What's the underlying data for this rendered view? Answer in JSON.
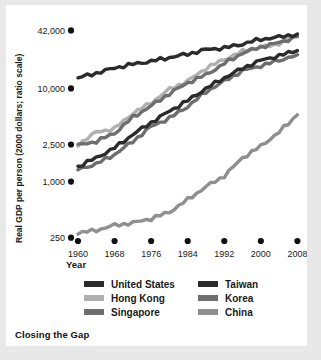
{
  "caption": "Closing the Gap",
  "axes": {
    "ylabel": "Real GDP per person (2000 dollars; ratio scale)",
    "xlabel": "Year",
    "yticks": [
      "250",
      "1,000",
      "2,500",
      "10,000",
      "42,000"
    ],
    "xticks": [
      "1960",
      "1968",
      "1976",
      "1984",
      "1992",
      "2000",
      "2008"
    ]
  },
  "legend": {
    "left": [
      {
        "label": "United States",
        "color": "#2b2b2b"
      },
      {
        "label": "Hong Kong",
        "color": "#b0b0b0"
      },
      {
        "label": "Singapore",
        "color": "#6e6e6e"
      }
    ],
    "right": [
      {
        "label": "Taiwan",
        "color": "#2b2b2b"
      },
      {
        "label": "Korea",
        "color": "#6e6e6e"
      },
      {
        "label": "China",
        "color": "#8f8f8f"
      }
    ]
  },
  "chart_data": {
    "type": "line",
    "title": "Closing the Gap",
    "xlabel": "Year",
    "ylabel": "Real GDP per person (2000 dollars; ratio scale)",
    "yscale": "log",
    "ylim": [
      230,
      48000
    ],
    "xlim": [
      1960,
      2009
    ],
    "ytick_values": [
      250,
      1000,
      2500,
      10000,
      42000
    ],
    "xtick_values": [
      1960,
      1968,
      1976,
      1984,
      1992,
      2000,
      2008
    ],
    "grid": false,
    "legend_position": "below",
    "series": [
      {
        "name": "United States",
        "color": "#2b2b2b",
        "x": [
          1960,
          1964,
          1968,
          1972,
          1976,
          1980,
          1984,
          1988,
          1992,
          1996,
          2000,
          2004,
          2008
        ],
        "values": [
          13000,
          14600,
          16600,
          18200,
          19600,
          21500,
          23400,
          26200,
          27200,
          30000,
          33800,
          35600,
          38500
        ]
      },
      {
        "name": "Hong Kong",
        "color": "#b0b0b0",
        "x": [
          1960,
          1964,
          1968,
          1972,
          1976,
          1980,
          1984,
          1988,
          1992,
          1996,
          2000,
          2004,
          2008
        ],
        "values": [
          2500,
          3400,
          3700,
          5400,
          7000,
          9800,
          12000,
          16500,
          20500,
          25000,
          27500,
          30500,
          37000
        ]
      },
      {
        "name": "Singapore",
        "color": "#6e6e6e",
        "x": [
          1960,
          1964,
          1968,
          1972,
          1976,
          1980,
          1984,
          1988,
          1992,
          1996,
          2000,
          2004,
          2008
        ],
        "values": [
          2450,
          2700,
          3300,
          4900,
          6500,
          8800,
          11500,
          14000,
          18500,
          24000,
          28000,
          31000,
          36000
        ]
      },
      {
        "name": "Taiwan",
        "color": "#2b2b2b",
        "x": [
          1960,
          1964,
          1968,
          1972,
          1976,
          1980,
          1984,
          1988,
          1992,
          1996,
          2000,
          2004,
          2008
        ],
        "values": [
          1450,
          1800,
          2300,
          3200,
          4300,
          5700,
          7400,
          10000,
          13000,
          16500,
          20000,
          22500,
          25500
        ]
      },
      {
        "name": "Korea",
        "color": "#6e6e6e",
        "x": [
          1960,
          1964,
          1968,
          1972,
          1976,
          1980,
          1984,
          1988,
          1992,
          1996,
          2000,
          2004,
          2008
        ],
        "values": [
          1350,
          1550,
          1950,
          2700,
          3900,
          4800,
          6400,
          9200,
          12000,
          15500,
          17500,
          20000,
          23000
        ]
      },
      {
        "name": "China",
        "color": "#8f8f8f",
        "x": [
          1960,
          1964,
          1968,
          1972,
          1976,
          1980,
          1984,
          1988,
          1992,
          1996,
          2000,
          2004,
          2008
        ],
        "values": [
          280,
          300,
          340,
          360,
          400,
          470,
          640,
          880,
          1150,
          1800,
          2400,
          3400,
          5200
        ]
      }
    ]
  }
}
